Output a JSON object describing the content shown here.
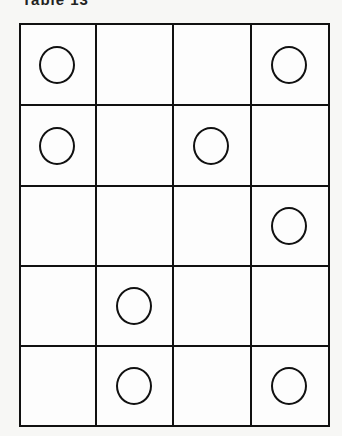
{
  "title": "Table 13",
  "grid": {
    "rows": 5,
    "cols": 4,
    "cells": [
      [
        true,
        false,
        false,
        true
      ],
      [
        true,
        false,
        true,
        false
      ],
      [
        false,
        false,
        false,
        true
      ],
      [
        false,
        true,
        false,
        false
      ],
      [
        false,
        true,
        false,
        true
      ]
    ]
  },
  "colors": {
    "line": "#111111",
    "background": "#f7f7f5"
  }
}
